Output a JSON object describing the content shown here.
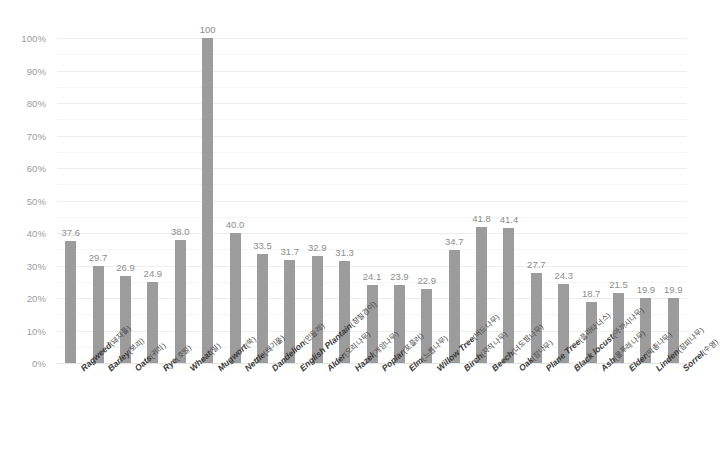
{
  "chart_data": {
    "type": "bar",
    "title": "",
    "subtitle": "",
    "xlabel": "",
    "ylabel": "",
    "ylim": [
      0,
      100
    ],
    "ytick_values": [
      0,
      10,
      20,
      30,
      40,
      50,
      60,
      70,
      80,
      90,
      100
    ],
    "ytick_labels": [
      "0%",
      "10%",
      "20%",
      "30%",
      "40%",
      "50%",
      "60%",
      "70%",
      "80%",
      "90%",
      "100%"
    ],
    "minor_gridlines": [
      5,
      15,
      25,
      35,
      45,
      55,
      65,
      75,
      85,
      95
    ],
    "grid": true,
    "legend": null,
    "bar_color": "#9c9c9c",
    "gridline_color": "#eceded",
    "value_label_color": "#8d8d8d",
    "axis_label_color": "#9b9b9b",
    "categories": [
      "Ragweed(돼지풀)",
      "Barley(보리)",
      "Oats(귀리)",
      "Rye(호밀)",
      "Wheat(밀)",
      "Mugwort(쑥)",
      "Nettle(쐐기풀)",
      "Dandelion(민들레)",
      "English Plantain(창질경이)",
      "Alder(오리나무)",
      "Hazel(개암나무)",
      "Poplar(포플러)",
      "Elm(느릅나무)",
      "Willow Tree(버드나무)",
      "Birch(자작나무)",
      "Beech(너도밤나무)",
      "Oak(참나무)",
      "Plane Tree(플라타너스)",
      "Black locust(아까시나무)",
      "Ash(물푸레나무)",
      "Elder(딱총나무)",
      "Linden(참피나무)",
      "Sorrel(수영)"
    ],
    "category_en": [
      "Ragweed",
      "Barley",
      "Oats",
      "Rye",
      "Wheat",
      "Mugwort",
      "Nettle",
      "Dandelion",
      "English Plantain",
      "Alder",
      "Hazel",
      "Poplar",
      "Elm",
      "Willow Tree",
      "Birch",
      "Beech",
      "Oak",
      "Plane Tree",
      "Black locust",
      "Ash",
      "Elder",
      "Linden",
      "Sorrel"
    ],
    "category_ko": [
      "(돼지풀)",
      "(보리)",
      "(귀리)",
      "(호밀)",
      "(밀)",
      "(쑥)",
      "(쐐기풀)",
      "(민들레)",
      "(창질경이)",
      "(오리나무)",
      "(개암나무)",
      "(포플러)",
      "(느릅나무)",
      "(버드나무)",
      "(자작나무)",
      "(너도밤나무)",
      "(참나무)",
      "(플라타너스)",
      "(아까시나무)",
      "(물푸레나무)",
      "(딱총나무)",
      "(참피나무)",
      "(수영)"
    ],
    "values": [
      37.6,
      29.7,
      26.9,
      24.9,
      38.0,
      100,
      40.0,
      33.5,
      31.7,
      32.9,
      31.3,
      24.1,
      23.9,
      22.9,
      34.7,
      41.8,
      41.4,
      27.7,
      24.3,
      18.7,
      21.5,
      19.9,
      19.9
    ],
    "value_labels": [
      "37.6",
      "29.7",
      "26.9",
      "24.9",
      "38.0",
      "100",
      "40.0",
      "33.5",
      "31.7",
      "32.9",
      "31.3",
      "24.1",
      "23.9",
      "22.9",
      "34.7",
      "41.8",
      "41.4",
      "27.7",
      "24.3",
      "18.7",
      "21.5",
      "19.9",
      "19.9"
    ]
  }
}
